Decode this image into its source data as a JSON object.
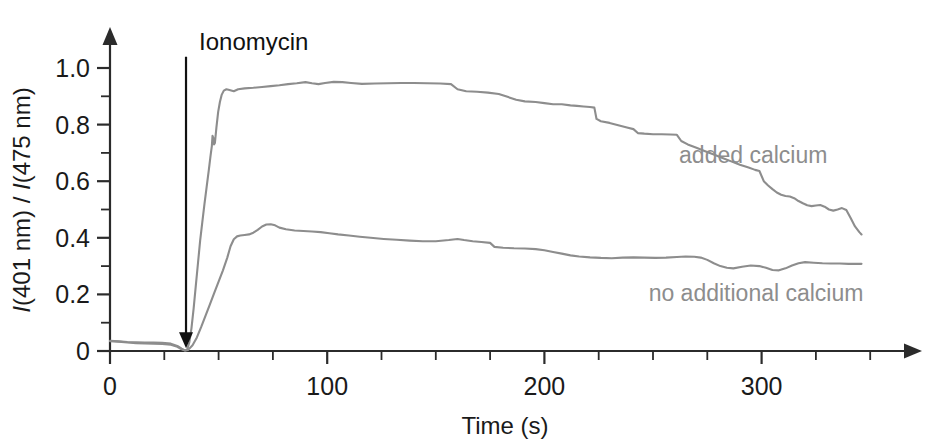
{
  "chart_data": {
    "type": "line",
    "title": "",
    "xlabel": "Time (s)",
    "ylabel": "I(401 nm) / I(475 nm)",
    "ylabel_parts": {
      "i1": "I",
      "t1": "(401 nm) / ",
      "i2": "I",
      "t2": "(475 nm)"
    },
    "xlim": [
      0,
      350
    ],
    "ylim": [
      0,
      1.08
    ],
    "x_major_ticks": [
      0,
      100,
      200,
      300
    ],
    "x_major_tick_labels": [
      "0",
      "100",
      "200",
      "300"
    ],
    "x_minor_tick_step": 25,
    "y_major_ticks": [
      0,
      0.2,
      0.4,
      0.6,
      0.8,
      1.0
    ],
    "y_major_tick_labels": [
      "0",
      "0.2",
      "0.4",
      "0.6",
      "0.8",
      "1.0"
    ],
    "y_minor_tick_step": 0.1,
    "grid": false,
    "legend": "inline-labels",
    "axis_color": "#2b2b2b",
    "series_color": "#8d8d8d",
    "annotations": [
      {
        "name": "ionomycin-arrow",
        "label": "Ionomycin",
        "x": 35,
        "y_from": 1.04,
        "y_to": 0.01,
        "style": "down-arrow"
      }
    ],
    "series": [
      {
        "name": "added calcium",
        "label": "added calcium",
        "label_x": 262,
        "label_y": 0.665,
        "color": "#8d8d8d",
        "points": [
          [
            0,
            0.035
          ],
          [
            4,
            0.033
          ],
          [
            8,
            0.03
          ],
          [
            12,
            0.028
          ],
          [
            16,
            0.027
          ],
          [
            20,
            0.026
          ],
          [
            24,
            0.025
          ],
          [
            28,
            0.022
          ],
          [
            31,
            0.015
          ],
          [
            33,
            0.006
          ],
          [
            34.5,
            0.002
          ],
          [
            35.5,
            0.004
          ],
          [
            36.5,
            0.03
          ],
          [
            37.5,
            0.08
          ],
          [
            38.5,
            0.15
          ],
          [
            39.5,
            0.23
          ],
          [
            40.5,
            0.31
          ],
          [
            41.5,
            0.39
          ],
          [
            42.5,
            0.455
          ],
          [
            43.5,
            0.52
          ],
          [
            44.5,
            0.58
          ],
          [
            45.5,
            0.64
          ],
          [
            46.3,
            0.69
          ],
          [
            46.9,
            0.725
          ],
          [
            47.2,
            0.76
          ],
          [
            47.6,
            0.752
          ],
          [
            47.9,
            0.73
          ],
          [
            48.3,
            0.735
          ],
          [
            49.0,
            0.79
          ],
          [
            49.8,
            0.845
          ],
          [
            50.6,
            0.88
          ],
          [
            51.4,
            0.905
          ],
          [
            52.4,
            0.92
          ],
          [
            53.6,
            0.925
          ],
          [
            55,
            0.922
          ],
          [
            57,
            0.918
          ],
          [
            59,
            0.925
          ],
          [
            62,
            0.928
          ],
          [
            66,
            0.93
          ],
          [
            70,
            0.933
          ],
          [
            74,
            0.936
          ],
          [
            78,
            0.939
          ],
          [
            82,
            0.943
          ],
          [
            86,
            0.946
          ],
          [
            90,
            0.95
          ],
          [
            93,
            0.946
          ],
          [
            96,
            0.943
          ],
          [
            99,
            0.947
          ],
          [
            103,
            0.951
          ],
          [
            107,
            0.95
          ],
          [
            111,
            0.947
          ],
          [
            116,
            0.944
          ],
          [
            122,
            0.945
          ],
          [
            128,
            0.946
          ],
          [
            134,
            0.947
          ],
          [
            140,
            0.947
          ],
          [
            146,
            0.946
          ],
          [
            152,
            0.945
          ],
          [
            157,
            0.943
          ],
          [
            160,
            0.925
          ],
          [
            164,
            0.918
          ],
          [
            169,
            0.916
          ],
          [
            174,
            0.913
          ],
          [
            179,
            0.908
          ],
          [
            183,
            0.898
          ],
          [
            187,
            0.888
          ],
          [
            191,
            0.882
          ],
          [
            196,
            0.88
          ],
          [
            200,
            0.876
          ],
          [
            204,
            0.872
          ],
          [
            208,
            0.872
          ],
          [
            212,
            0.868
          ],
          [
            215,
            0.866
          ],
          [
            218,
            0.864
          ],
          [
            221,
            0.862
          ],
          [
            223,
            0.86
          ],
          [
            224,
            0.82
          ],
          [
            226,
            0.812
          ],
          [
            230,
            0.806
          ],
          [
            234,
            0.798
          ],
          [
            238,
            0.79
          ],
          [
            241,
            0.784
          ],
          [
            243,
            0.77
          ],
          [
            246,
            0.768
          ],
          [
            250,
            0.766
          ],
          [
            254,
            0.766
          ],
          [
            258,
            0.765
          ],
          [
            261,
            0.764
          ],
          [
            263,
            0.742
          ],
          [
            266,
            0.73
          ],
          [
            270,
            0.718
          ],
          [
            274,
            0.706
          ],
          [
            278,
            0.694
          ],
          [
            282,
            0.682
          ],
          [
            286,
            0.67
          ],
          [
            290,
            0.658
          ],
          [
            294,
            0.648
          ],
          [
            297,
            0.64
          ],
          [
            299,
            0.636
          ],
          [
            301,
            0.6
          ],
          [
            303,
            0.585
          ],
          [
            305,
            0.572
          ],
          [
            307,
            0.56
          ],
          [
            309,
            0.552
          ],
          [
            311,
            0.548
          ],
          [
            313,
            0.546
          ],
          [
            315,
            0.54
          ],
          [
            317,
            0.53
          ],
          [
            319,
            0.522
          ],
          [
            321,
            0.515
          ],
          [
            323,
            0.512
          ],
          [
            325,
            0.514
          ],
          [
            327,
            0.516
          ],
          [
            329,
            0.51
          ],
          [
            331,
            0.5
          ],
          [
            333,
            0.496
          ],
          [
            335,
            0.5
          ],
          [
            337,
            0.505
          ],
          [
            339,
            0.498
          ],
          [
            341,
            0.47
          ],
          [
            343,
            0.44
          ],
          [
            345,
            0.42
          ],
          [
            346,
            0.412
          ]
        ]
      },
      {
        "name": "no additional calcium",
        "label": "no additional calcium",
        "label_x": 248,
        "label_y": 0.175,
        "color": "#8d8d8d",
        "points": [
          [
            0,
            0.036
          ],
          [
            4,
            0.034
          ],
          [
            8,
            0.032
          ],
          [
            12,
            0.031
          ],
          [
            16,
            0.03
          ],
          [
            20,
            0.03
          ],
          [
            24,
            0.029
          ],
          [
            28,
            0.026
          ],
          [
            31,
            0.018
          ],
          [
            33,
            0.008
          ],
          [
            34.5,
            0.002
          ],
          [
            36,
            0.004
          ],
          [
            38,
            0.02
          ],
          [
            40,
            0.048
          ],
          [
            42,
            0.085
          ],
          [
            44,
            0.125
          ],
          [
            46,
            0.165
          ],
          [
            48,
            0.205
          ],
          [
            50,
            0.245
          ],
          [
            52,
            0.285
          ],
          [
            54,
            0.33
          ],
          [
            55.5,
            0.37
          ],
          [
            57,
            0.395
          ],
          [
            58.5,
            0.405
          ],
          [
            60,
            0.408
          ],
          [
            62,
            0.41
          ],
          [
            64,
            0.412
          ],
          [
            66,
            0.418
          ],
          [
            68,
            0.428
          ],
          [
            70,
            0.44
          ],
          [
            72,
            0.447
          ],
          [
            74,
            0.448
          ],
          [
            76,
            0.444
          ],
          [
            78,
            0.436
          ],
          [
            81,
            0.43
          ],
          [
            85,
            0.426
          ],
          [
            89,
            0.424
          ],
          [
            93,
            0.422
          ],
          [
            97,
            0.42
          ],
          [
            101,
            0.416
          ],
          [
            105,
            0.412
          ],
          [
            110,
            0.408
          ],
          [
            115,
            0.404
          ],
          [
            120,
            0.4
          ],
          [
            126,
            0.396
          ],
          [
            132,
            0.393
          ],
          [
            138,
            0.39
          ],
          [
            144,
            0.388
          ],
          [
            150,
            0.388
          ],
          [
            156,
            0.392
          ],
          [
            160,
            0.396
          ],
          [
            163,
            0.392
          ],
          [
            167,
            0.388
          ],
          [
            171,
            0.385
          ],
          [
            175,
            0.382
          ],
          [
            177,
            0.368
          ],
          [
            181,
            0.365
          ],
          [
            186,
            0.363
          ],
          [
            191,
            0.362
          ],
          [
            196,
            0.36
          ],
          [
            200,
            0.356
          ],
          [
            204,
            0.35
          ],
          [
            208,
            0.344
          ],
          [
            212,
            0.338
          ],
          [
            216,
            0.334
          ],
          [
            221,
            0.331
          ],
          [
            226,
            0.329
          ],
          [
            231,
            0.328
          ],
          [
            236,
            0.33
          ],
          [
            241,
            0.331
          ],
          [
            246,
            0.33
          ],
          [
            251,
            0.329
          ],
          [
            256,
            0.33
          ],
          [
            261,
            0.332
          ],
          [
            265,
            0.334
          ],
          [
            269,
            0.333
          ],
          [
            272,
            0.33
          ],
          [
            275,
            0.322
          ],
          [
            278,
            0.31
          ],
          [
            281,
            0.3
          ],
          [
            284,
            0.294
          ],
          [
            287,
            0.292
          ],
          [
            291,
            0.298
          ],
          [
            295,
            0.302
          ],
          [
            299,
            0.3
          ],
          [
            302,
            0.294
          ],
          [
            305,
            0.286
          ],
          [
            308,
            0.285
          ],
          [
            311,
            0.292
          ],
          [
            314,
            0.302
          ],
          [
            317,
            0.31
          ],
          [
            320,
            0.314
          ],
          [
            324,
            0.312
          ],
          [
            328,
            0.31
          ],
          [
            332,
            0.309
          ],
          [
            336,
            0.309
          ],
          [
            340,
            0.308
          ],
          [
            344,
            0.308
          ],
          [
            346,
            0.308
          ]
        ]
      }
    ]
  }
}
